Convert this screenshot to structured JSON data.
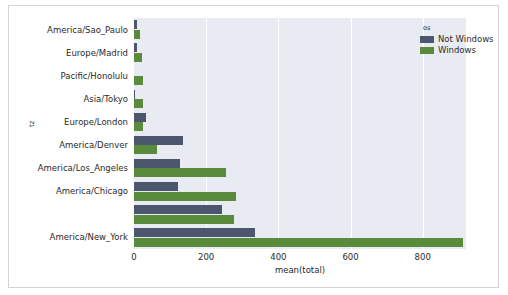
{
  "chart_data": {
    "type": "bar",
    "orientation": "horizontal",
    "title": "",
    "xlabel": "mean(total)",
    "ylabel": "tz",
    "xlim": [
      0,
      920
    ],
    "xticks": [
      "0",
      "200",
      "400",
      "600",
      "800"
    ],
    "xtick_values": [
      0,
      200,
      400,
      600,
      800
    ],
    "grid": true,
    "grid_axis": "x",
    "legend": {
      "title": "os",
      "position": "top-right",
      "entries": [
        {
          "label": "Not Windows",
          "color": "#4c566d"
        },
        {
          "label": "Windows",
          "color": "#5a8a3c"
        }
      ]
    },
    "categories": [
      "America/Sao_Paulo",
      "Europe/Madrid",
      "Pacific/Honolulu",
      "Asia/Tokyo",
      "Europe/London",
      "America/Denver",
      "America/Los_Angeles",
      "America/Chicago",
      "",
      "America/New_York"
    ],
    "series": [
      {
        "name": "Not Windows",
        "color": "#4c566d",
        "values": [
          7,
          7,
          0,
          3,
          34,
          135,
          127,
          121,
          245,
          335
        ]
      },
      {
        "name": "Windows",
        "color": "#5a8a3c",
        "values": [
          17,
          21,
          26,
          24,
          25,
          65,
          254,
          282,
          276,
          913
        ]
      }
    ]
  },
  "style": {
    "plot_background": "#e8ecf2",
    "page_background": "#ffffff",
    "frame_border": "#d4d4d4",
    "gridline_color": "#ffffff",
    "text_color": "#2b2b2b"
  }
}
